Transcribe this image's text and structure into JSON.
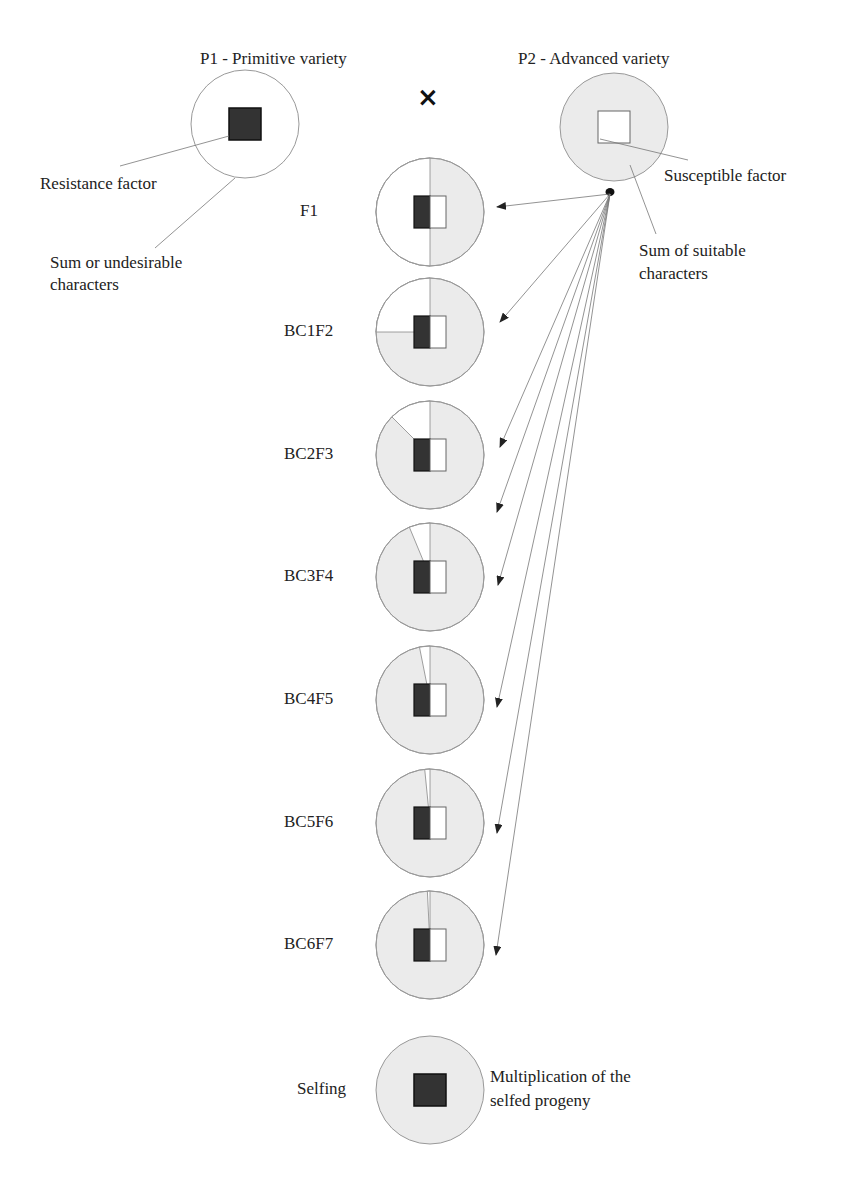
{
  "parents": {
    "p1": {
      "title": "P1 - Primitive variety",
      "cx": 245,
      "cy": 124,
      "r": 54,
      "fill": "#ffffff",
      "square_fill": "#333333"
    },
    "p2": {
      "title": "P2 - Advanced variety",
      "cx": 614,
      "cy": 127,
      "r": 54,
      "fill": "#ebebeb",
      "square_fill": "#ffffff"
    }
  },
  "cross_symbol": "×",
  "annotations": {
    "resistance_factor": "Resistance factor",
    "sum_undesirable_1": "Sum or undesirable",
    "sum_undesirable_2": "characters",
    "susceptible_factor": "Susceptible factor",
    "sum_suitable_1": "Sum of suitable",
    "sum_suitable_2": "characters",
    "multiplication_1": "Multiplication of the",
    "multiplication_2": "selfed progeny"
  },
  "colors": {
    "primitive_fill": "#ffffff",
    "advanced_fill": "#ebebeb",
    "resistance_square": "#333333",
    "susceptible_square": "#ffffff",
    "outline": "#999999",
    "line": "#777777"
  },
  "generations": [
    {
      "label": "F1",
      "cy": 212,
      "primitive_fraction": 0.5
    },
    {
      "label": "BC1F2",
      "cy": 332,
      "primitive_fraction": 0.25
    },
    {
      "label": "BC2F3",
      "cy": 455,
      "primitive_fraction": 0.125
    },
    {
      "label": "BC3F4",
      "cy": 577,
      "primitive_fraction": 0.0625
    },
    {
      "label": "BC4F5",
      "cy": 700,
      "primitive_fraction": 0.03125
    },
    {
      "label": "BC5F6",
      "cy": 823,
      "primitive_fraction": 0.015625
    },
    {
      "label": "BC6F7",
      "cy": 945,
      "primitive_fraction": 0.0078125
    }
  ],
  "selfing": {
    "label": "Selfing",
    "cy": 1090
  },
  "progeny_cx": 430,
  "progeny_r": 54,
  "source_dot": {
    "x": 610,
    "y": 192
  },
  "arrow_targets": [
    {
      "x": 497,
      "y": 207
    },
    {
      "x": 500,
      "y": 322
    },
    {
      "x": 500,
      "y": 447
    },
    {
      "x": 497,
      "y": 512
    },
    {
      "x": 498,
      "y": 585
    },
    {
      "x": 497,
      "y": 707
    },
    {
      "x": 497,
      "y": 833
    },
    {
      "x": 496,
      "y": 955
    }
  ]
}
